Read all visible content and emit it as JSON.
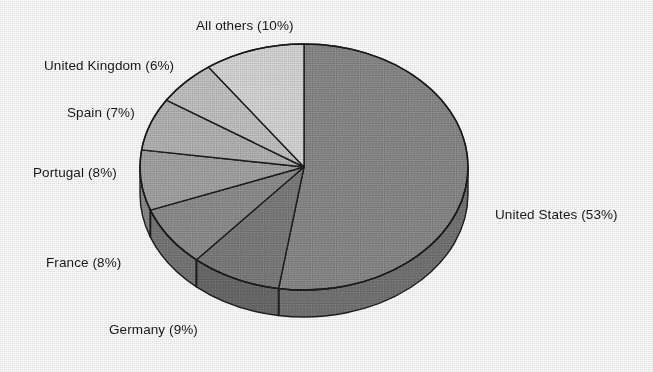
{
  "chart_data": {
    "type": "pie",
    "title": "",
    "subtitle": "",
    "xlabel": "",
    "ylabel": "",
    "legend_position": "none",
    "grid": false,
    "style": "3d-exploded-none-grayscale",
    "labels_show_percent": true,
    "start_angle_deg": 0,
    "direction": "clockwise",
    "categories": [
      "United States",
      "Germany",
      "France",
      "Portugal",
      "Spain",
      "United Kingdom",
      "All others"
    ],
    "values": [
      53,
      9,
      8,
      8,
      7,
      6,
      10
    ],
    "units": "percent",
    "total": 101,
    "slices": [
      {
        "name": "United States",
        "value": 53,
        "label": "United States (53%)",
        "color": "#8a8a8a",
        "side_color": "#757575",
        "label_x": 495,
        "label_y": 207
      },
      {
        "name": "Germany",
        "value": 9,
        "label": "Germany (9%)",
        "color": "#7d7d7d",
        "side_color": "#6a6a6a",
        "label_x": 109,
        "label_y": 322
      },
      {
        "name": "France",
        "value": 8,
        "label": "France (8%)",
        "color": "#8f8f8f",
        "side_color": "#787878",
        "label_x": 46,
        "label_y": 255
      },
      {
        "name": "Portugal",
        "value": 8,
        "label": "Portugal (8%)",
        "color": "#a5a5a5",
        "side_color": "#8b8b8b",
        "label_x": 33,
        "label_y": 165
      },
      {
        "name": "Spain",
        "value": 7,
        "label": "Spain (7%)",
        "color": "#b5b5b5",
        "side_color": "#9a9a9a",
        "label_x": 67,
        "label_y": 105
      },
      {
        "name": "United Kingdom",
        "value": 6,
        "label": "United Kingdom (6%)",
        "color": "#c4c4c4",
        "side_color": "#a8a8a8",
        "label_x": 44,
        "label_y": 58
      },
      {
        "name": "All others",
        "value": 10,
        "label": "All others (10%)",
        "color": "#d8d8d8",
        "side_color": "#bcbcbc",
        "label_x": 196,
        "label_y": 18
      }
    ],
    "geometry": {
      "center_x": 304,
      "center_y": 167,
      "radius_x": 164,
      "radius_y": 123,
      "depth": 27
    },
    "colors": {
      "background": "#ffffff",
      "outline": "#1c1c1c",
      "text": "#1a1a1a"
    }
  }
}
